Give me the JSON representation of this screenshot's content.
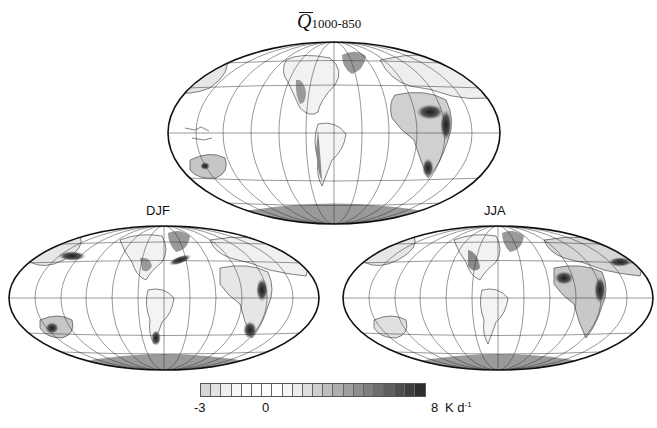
{
  "chart_data": {
    "type": "heatmap",
    "subtype": "global-map-mollweide",
    "title_symbol": "Q",
    "title_subscript": "1000-850",
    "panels": [
      {
        "id": "annual",
        "label": "",
        "description": "Annual mean low-level (1000-850 hPa) diabatic heating",
        "maxima": [
          "Sahara/Arabia",
          "India",
          "southern Africa",
          "Australia",
          "Andes",
          "western North America",
          "Tibetan Plateau region"
        ]
      },
      {
        "id": "djf",
        "label": "DJF",
        "description": "December-January-February",
        "maxima": [
          "southern Africa",
          "Australia",
          "Argentina",
          "Gulf Stream",
          "Kuroshio"
        ]
      },
      {
        "id": "jja",
        "label": "JJA",
        "description": "June-July-August",
        "maxima": [
          "Sahara",
          "Arabia",
          "India",
          "western North America",
          "Tibet"
        ]
      }
    ],
    "colorbar": {
      "min": -3,
      "max": 8,
      "tick_labels": [
        "-3",
        "0",
        "8"
      ],
      "unit": "K d",
      "unit_superscript": "-1",
      "n_levels": 22,
      "colors": [
        "#d6d6d6",
        "#e2e2e2",
        "#eeeeee",
        "#f8f8f8",
        "#ffffff",
        "#ffffff",
        "#ffffff",
        "#ffffff",
        "#f6f6f6",
        "#ececec",
        "#dedede",
        "#cecece",
        "#bebebe",
        "#aeaeae",
        "#9e9e9e",
        "#8e8e8e",
        "#7e7e7e",
        "#6e6e6e",
        "#5e5e5e",
        "#4e4e4e",
        "#3e3e3e",
        "#2e2e2e"
      ]
    },
    "projection": "Mollweide",
    "grid": true,
    "land_mask_color": "#9a9a9a"
  },
  "labels": {
    "title_sub": "1000-850",
    "title_q": "Q",
    "djf": "DJF",
    "jja": "JJA",
    "tick_min": "-3",
    "tick_zero": "0",
    "tick_max": "8",
    "unit_main": "K d",
    "unit_sup": "-1"
  }
}
